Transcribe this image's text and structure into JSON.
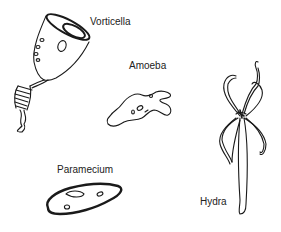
{
  "diagram": {
    "organisms": [
      {
        "id": "vorticella",
        "label": "Vorticella"
      },
      {
        "id": "amoeba",
        "label": "Amoeba"
      },
      {
        "id": "paramecium",
        "label": "Paramecium"
      },
      {
        "id": "hydra",
        "label": "Hydra"
      }
    ],
    "colors": {
      "ink": "#1a1a1a",
      "background": "#ffffff"
    }
  }
}
